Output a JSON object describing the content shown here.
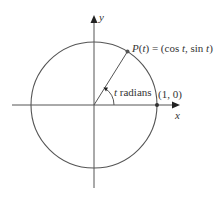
{
  "diagram": {
    "axes": {
      "x_label": "x",
      "y_label": "y"
    },
    "point_P": {
      "label_prefix": "P(",
      "label_var": "t",
      "label_mid": ") = (cos ",
      "label_var2": "t",
      "label_mid2": ", sin ",
      "label_var3": "t",
      "label_end": ")",
      "full_label": "P(t) = (cos t, sin t)"
    },
    "point_1_0": {
      "label": "(1, 0)"
    },
    "angle": {
      "var": "t",
      "unit": " radians",
      "full_label": "t radians"
    },
    "colors": {
      "line": "#555555",
      "text": "#333333",
      "background": "#ffffff"
    }
  }
}
